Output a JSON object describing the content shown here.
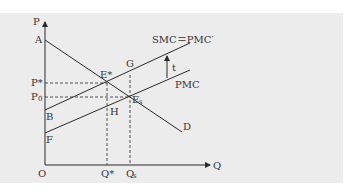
{
  "diagram": {
    "type": "externality-tax-supply-demand",
    "axes": {
      "y_label": "P",
      "x_label": "Q",
      "origin_label": "O"
    },
    "price_labels": {
      "p_star": "P*",
      "p_zero": "P",
      "p_zero_sub": "0"
    },
    "quantity_labels": {
      "q_star": "Q*",
      "q_s": "Q",
      "q_s_sub": "s"
    },
    "curves": {
      "demand": {
        "label": "D",
        "start_label": "A"
      },
      "smc": {
        "label": "SMC＝PMC′",
        "start_label": "B"
      },
      "pmc": {
        "label": "PMC",
        "start_label": "F"
      }
    },
    "points": {
      "e_star": "E*",
      "e_s": "E",
      "e_s_sub": "s",
      "g": "G",
      "h": "H"
    },
    "tax_label": "t",
    "colors": {
      "background": "#ececec",
      "line": "#2a2a2a",
      "text": "#333333"
    }
  }
}
